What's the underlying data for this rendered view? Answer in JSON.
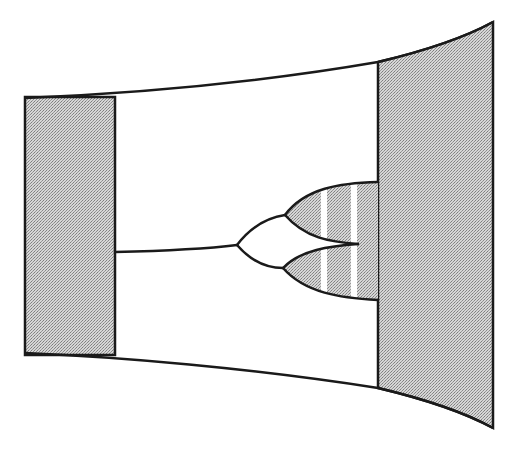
{
  "diagram": {
    "title": "",
    "width": 517,
    "height": 450,
    "colors": {
      "background": "#ffffff",
      "stroke": "#1a1a1a",
      "stipple_light": "#ffffff",
      "stipple_dark": "#9a9a9a",
      "stripe": "#ffffff"
    },
    "left_panel": {
      "shape": "shaded-rectangle",
      "fill": "stippled-gray"
    },
    "right_panel": {
      "shape": "shaded-trapezoid-curved",
      "fill": "stippled-gray"
    },
    "channel": {
      "shape": "flared-curved-funnel",
      "fill": "white"
    },
    "tree": {
      "stem": "single line from left panel",
      "forks": 3,
      "lobes": [
        {
          "name": "upper-lobe",
          "fill": "stippled-gray",
          "stripes": 2
        },
        {
          "name": "lower-lobe",
          "fill": "stippled-gray",
          "stripes": 2
        }
      ]
    },
    "labels": []
  }
}
